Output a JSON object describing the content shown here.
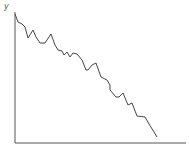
{
  "chart_data": {
    "type": "line",
    "title": "",
    "xlabel": "",
    "ylabel": "y",
    "grid": false,
    "legend": null,
    "line_color": "#444444",
    "axis_color": "#555555",
    "x": [
      0,
      3,
      7,
      10,
      13,
      18,
      21,
      25,
      30,
      36,
      40,
      43,
      47,
      49,
      52,
      55,
      58,
      62,
      67,
      71,
      73,
      77,
      81,
      86,
      92,
      95,
      95,
      101,
      104,
      108,
      113,
      117,
      122,
      130,
      134,
      139,
      142
    ],
    "values": [
      129,
      121,
      119,
      116,
      105,
      113,
      106,
      100,
      100,
      109,
      98,
      93,
      92,
      88,
      91,
      86,
      90,
      89,
      83,
      73,
      73,
      78,
      80,
      66,
      63,
      58,
      53,
      46,
      46,
      50,
      38,
      40,
      27,
      26,
      19,
      11,
      6
    ],
    "ylim": [
      0,
      131
    ],
    "xlim": [
      0,
      171
    ]
  }
}
